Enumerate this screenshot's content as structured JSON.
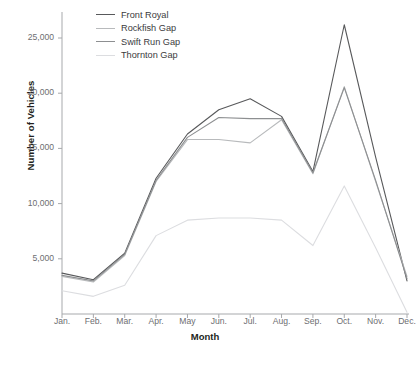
{
  "chart_data": {
    "type": "line",
    "title": "",
    "xlabel": "Month",
    "ylabel": "Number of Vehicles",
    "categories": [
      "Jan.",
      "Feb.",
      "Mar.",
      "Apr.",
      "May",
      "Jun.",
      "Jul.",
      "Aug.",
      "Sep.",
      "Oct.",
      "Nov.",
      "Dec."
    ],
    "ylim": [
      0,
      27500
    ],
    "yticks": [
      5000,
      10000,
      15000,
      20000,
      25000
    ],
    "ytick_labels": [
      "5,000",
      "10,000",
      "15,000",
      "20,000",
      "25,000"
    ],
    "grid": false,
    "legend_position": "top-left",
    "series": [
      {
        "name": "Front Royal",
        "color": "#58595b",
        "values": [
          3700,
          3100,
          5500,
          12300,
          16300,
          18500,
          19500,
          17900,
          12900,
          26200,
          14200,
          3000
        ]
      },
      {
        "name": "Rockfish Gap",
        "color": "#b8babc",
        "values": [
          3400,
          2900,
          5300,
          12000,
          15800,
          15800,
          15500,
          17600,
          12700,
          20600,
          12000,
          3400
        ]
      },
      {
        "name": "Swift Run Gap",
        "color": "#8d8f91",
        "values": [
          3500,
          3000,
          5400,
          12100,
          16000,
          17800,
          17700,
          17700,
          12800,
          20500,
          12100,
          3200
        ]
      },
      {
        "name": "Thornton Gap",
        "color": "#dcdde0",
        "values": [
          2100,
          1600,
          2600,
          7100,
          8500,
          8700,
          8700,
          8500,
          6200,
          11600,
          6000,
          150
        ]
      }
    ]
  },
  "legend": {
    "items": [
      {
        "label": "Front Royal"
      },
      {
        "label": "Rockfish Gap"
      },
      {
        "label": "Swift Run Gap"
      },
      {
        "label": "Thornton Gap"
      }
    ]
  },
  "axes": {
    "x_title": "Month",
    "y_title": "Number of Vehicles"
  }
}
